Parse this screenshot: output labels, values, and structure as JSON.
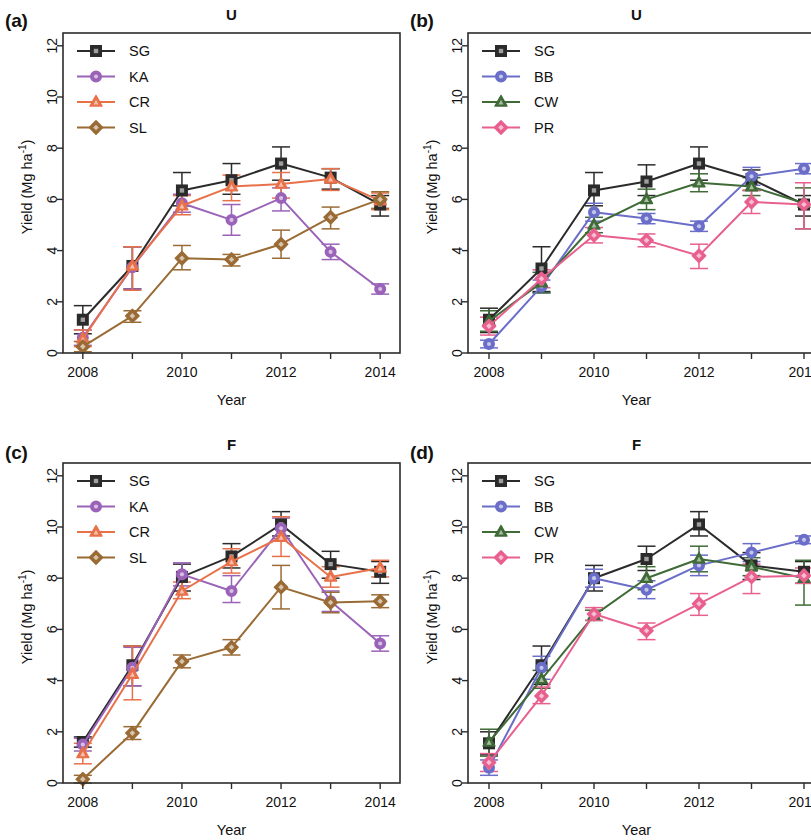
{
  "figure": {
    "panels": [
      {
        "id": "a",
        "label": "(a)",
        "title": "U",
        "xlabel": "Year",
        "ylabel": "Yield (Mg ha",
        "ylabel_sup": "-1",
        "ylabel_tail": ")"
      },
      {
        "id": "b",
        "label": "(b)",
        "title": "U",
        "xlabel": "Year",
        "ylabel": "Yield (Mg ha",
        "ylabel_sup": "-1",
        "ylabel_tail": ")"
      },
      {
        "id": "c",
        "label": "(c)",
        "title": "F",
        "xlabel": "Year",
        "ylabel": "Yield (Mg ha",
        "ylabel_sup": "-1",
        "ylabel_tail": ")"
      },
      {
        "id": "d",
        "label": "(d)",
        "title": "F",
        "xlabel": "Year",
        "ylabel": "Yield (Mg ha",
        "ylabel_sup": "-1",
        "ylabel_tail": ")"
      }
    ]
  },
  "colors": {
    "SG": "#2b2b2b",
    "KA": "#9a63b8",
    "CR": "#e8714a",
    "SL": "#9a6b35",
    "BB": "#6a6ec9",
    "CW": "#3f6b36",
    "PR": "#e8608f"
  },
  "chart_data": [
    {
      "panel": "a",
      "type": "line",
      "title": "U",
      "xlabel": "Year",
      "ylabel": "Yield (Mg ha-1)",
      "x": [
        2008,
        2009,
        2010,
        2011,
        2012,
        2013,
        2014
      ],
      "xticks": [
        2008,
        2009,
        2010,
        2011,
        2012,
        2013,
        2014
      ],
      "xticklabels": [
        "2008",
        "",
        "2010",
        "",
        "2012",
        "",
        "2014"
      ],
      "yticks": [
        0,
        2,
        4,
        6,
        8,
        10,
        12
      ],
      "yticklabels": [
        "0",
        "2",
        "4",
        "6",
        "8",
        "10",
        "12"
      ],
      "xlim": [
        2007.6,
        2014.4
      ],
      "ylim": [
        0,
        12.5
      ],
      "grid": false,
      "legend_position": "top-left",
      "series": [
        {
          "name": "SG",
          "marker": "square",
          "values": [
            1.3,
            3.4,
            6.35,
            6.75,
            7.4,
            6.85,
            5.8
          ],
          "err_lo": [
            0.55,
            0.9,
            0.6,
            0.55,
            0.65,
            0.45,
            0.45
          ],
          "err_hi": [
            0.55,
            0.75,
            0.7,
            0.65,
            0.65,
            0.35,
            0.35
          ]
        },
        {
          "name": "KA",
          "marker": "circle",
          "values": [
            0.6,
            3.35,
            5.85,
            5.2,
            6.05,
            3.95,
            2.5
          ],
          "err_lo": [
            0.3,
            0.85,
            0.35,
            0.6,
            0.5,
            0.3,
            0.2
          ],
          "err_hi": [
            0.3,
            0.8,
            0.35,
            0.6,
            0.4,
            0.3,
            0.2
          ]
        },
        {
          "name": "CR",
          "marker": "triangle",
          "values": [
            0.55,
            3.4,
            5.75,
            6.5,
            6.6,
            6.8,
            5.95
          ],
          "err_lo": [
            0.3,
            0.95,
            0.35,
            0.55,
            0.55,
            0.45,
            0.35
          ],
          "err_hi": [
            0.35,
            0.75,
            0.4,
            0.45,
            0.45,
            0.4,
            0.3
          ]
        },
        {
          "name": "SL",
          "marker": "diamond",
          "values": [
            0.25,
            1.45,
            3.7,
            3.65,
            4.25,
            5.3,
            6.0
          ],
          "err_lo": [
            0.2,
            0.25,
            0.45,
            0.25,
            0.55,
            0.45,
            0.35
          ],
          "err_hi": [
            0.2,
            0.2,
            0.5,
            0.2,
            0.55,
            0.4,
            0.3
          ]
        }
      ]
    },
    {
      "panel": "b",
      "type": "line",
      "title": "U",
      "xlabel": "Year",
      "ylabel": "Yield (Mg ha-1)",
      "x": [
        2008,
        2009,
        2010,
        2011,
        2012,
        2013,
        2014
      ],
      "xticks": [
        2008,
        2009,
        2010,
        2011,
        2012,
        2013,
        2014
      ],
      "xticklabels": [
        "2008",
        "",
        "2010",
        "",
        "2012",
        "",
        "2014"
      ],
      "yticks": [
        0,
        2,
        4,
        6,
        8,
        10,
        12
      ],
      "yticklabels": [
        "0",
        "2",
        "4",
        "6",
        "8",
        "10",
        "12"
      ],
      "xlim": [
        2007.6,
        2014.4
      ],
      "ylim": [
        0,
        12.5
      ],
      "grid": false,
      "legend_position": "top-left",
      "series": [
        {
          "name": "SG",
          "marker": "square",
          "values": [
            1.3,
            3.3,
            6.35,
            6.7,
            7.4,
            6.8,
            5.8
          ],
          "err_lo": [
            0.5,
            0.9,
            0.6,
            0.55,
            0.65,
            0.45,
            0.45
          ],
          "err_hi": [
            0.45,
            0.85,
            0.7,
            0.65,
            0.65,
            0.35,
            0.35
          ]
        },
        {
          "name": "BB",
          "marker": "circle",
          "values": [
            0.35,
            2.6,
            5.5,
            5.25,
            4.95,
            6.9,
            7.2
          ],
          "err_lo": [
            0.15,
            0.25,
            0.35,
            0.2,
            0.2,
            0.35,
            0.2
          ],
          "err_hi": [
            0.15,
            0.25,
            0.35,
            0.2,
            0.2,
            0.35,
            0.2
          ]
        },
        {
          "name": "CW",
          "marker": "triangle",
          "values": [
            1.25,
            2.75,
            5.0,
            6.0,
            6.65,
            6.5,
            5.85
          ],
          "err_lo": [
            0.4,
            0.4,
            0.3,
            0.4,
            0.35,
            0.35,
            1.0
          ],
          "err_hi": [
            0.4,
            0.4,
            0.3,
            0.4,
            0.35,
            0.35,
            0.6
          ]
        },
        {
          "name": "PR",
          "marker": "diamond",
          "values": [
            1.05,
            2.9,
            4.6,
            4.4,
            3.8,
            5.9,
            5.8
          ],
          "err_lo": [
            0.35,
            0.35,
            0.3,
            0.25,
            0.5,
            0.45,
            0.95
          ],
          "err_hi": [
            0.35,
            0.35,
            0.3,
            0.25,
            0.45,
            0.45,
            0.85
          ]
        }
      ]
    },
    {
      "panel": "c",
      "type": "line",
      "title": "F",
      "xlabel": "Year",
      "ylabel": "Yield (Mg ha-1)",
      "x": [
        2008,
        2009,
        2010,
        2011,
        2012,
        2013,
        2014
      ],
      "xticks": [
        2008,
        2009,
        2010,
        2011,
        2012,
        2013,
        2014
      ],
      "xticklabels": [
        "2008",
        "",
        "2010",
        "",
        "2012",
        "",
        "2014"
      ],
      "yticks": [
        0,
        2,
        4,
        6,
        8,
        10,
        12
      ],
      "yticklabels": [
        "0",
        "2",
        "4",
        "6",
        "8",
        "10",
        "12"
      ],
      "xlim": [
        2007.6,
        2014.4
      ],
      "ylim": [
        0,
        12.5
      ],
      "grid": false,
      "legend_position": "top-left",
      "series": [
        {
          "name": "SG",
          "marker": "square",
          "values": [
            1.6,
            4.6,
            8.05,
            8.85,
            10.1,
            8.55,
            8.25
          ],
          "err_lo": [
            0.2,
            0.8,
            0.55,
            0.45,
            0.45,
            0.55,
            0.45
          ],
          "err_hi": [
            0.2,
            0.75,
            0.5,
            0.5,
            0.5,
            0.5,
            0.4
          ]
        },
        {
          "name": "KA",
          "marker": "circle",
          "values": [
            1.5,
            4.5,
            8.15,
            7.5,
            9.95,
            7.1,
            5.45
          ],
          "err_lo": [
            0.25,
            0.7,
            0.45,
            0.45,
            0.4,
            0.4,
            0.3
          ],
          "err_hi": [
            0.25,
            0.8,
            0.45,
            0.6,
            0.4,
            0.4,
            0.3
          ]
        },
        {
          "name": "CR",
          "marker": "triangle",
          "values": [
            1.15,
            4.25,
            7.5,
            8.65,
            9.6,
            8.05,
            8.4
          ],
          "err_lo": [
            0.4,
            1.0,
            0.3,
            0.45,
            0.75,
            0.4,
            0.35
          ],
          "err_hi": [
            0.4,
            1.1,
            0.35,
            0.5,
            0.8,
            0.4,
            0.3
          ]
        },
        {
          "name": "SL",
          "marker": "diamond",
          "values": [
            0.15,
            1.95,
            4.75,
            5.3,
            7.65,
            7.05,
            7.1
          ],
          "err_lo": [
            0.15,
            0.25,
            0.25,
            0.3,
            0.85,
            0.4,
            0.25
          ],
          "err_hi": [
            0.15,
            0.25,
            0.25,
            0.3,
            0.85,
            0.4,
            0.25
          ]
        }
      ]
    },
    {
      "panel": "d",
      "type": "line",
      "title": "F",
      "xlabel": "Year",
      "ylabel": "Yield (Mg ha-1)",
      "x": [
        2008,
        2009,
        2010,
        2011,
        2012,
        2013,
        2014
      ],
      "xticks": [
        2008,
        2009,
        2010,
        2011,
        2012,
        2013,
        2014
      ],
      "xticklabels": [
        "2008",
        "",
        "2010",
        "",
        "2012",
        "",
        "2014"
      ],
      "yticks": [
        0,
        2,
        4,
        6,
        8,
        10,
        12
      ],
      "yticklabels": [
        "0",
        "2",
        "4",
        "6",
        "8",
        "10",
        "12"
      ],
      "xlim": [
        2007.6,
        2014.4
      ],
      "ylim": [
        0,
        12.5
      ],
      "grid": false,
      "legend_position": "top-left",
      "series": [
        {
          "name": "SG",
          "marker": "square",
          "values": [
            1.55,
            4.6,
            8.0,
            8.75,
            10.1,
            8.5,
            8.25
          ],
          "err_lo": [
            0.45,
            0.75,
            0.5,
            0.45,
            0.45,
            0.55,
            0.45
          ],
          "err_hi": [
            0.45,
            0.75,
            0.5,
            0.5,
            0.5,
            0.5,
            0.4
          ]
        },
        {
          "name": "BB",
          "marker": "circle",
          "values": [
            0.6,
            4.5,
            8.0,
            7.55,
            8.5,
            9.0,
            9.5
          ],
          "err_lo": [
            0.3,
            0.45,
            0.35,
            0.35,
            0.4,
            0.35,
            0.15
          ],
          "err_hi": [
            0.3,
            0.45,
            0.35,
            0.35,
            0.4,
            0.35,
            0.15
          ]
        },
        {
          "name": "CW",
          "marker": "triangle",
          "values": [
            1.6,
            4.05,
            6.55,
            8.0,
            8.75,
            8.45,
            8.0
          ],
          "err_lo": [
            0.55,
            0.35,
            0.2,
            0.45,
            0.5,
            0.35,
            1.05
          ],
          "err_hi": [
            0.5,
            0.35,
            0.2,
            0.45,
            0.5,
            0.35,
            0.7
          ]
        },
        {
          "name": "PR",
          "marker": "diamond",
          "values": [
            0.8,
            3.4,
            6.6,
            5.95,
            7.0,
            8.05,
            8.1
          ],
          "err_lo": [
            0.35,
            0.3,
            0.25,
            0.35,
            0.45,
            0.65,
            0.3
          ],
          "err_hi": [
            0.35,
            0.35,
            0.25,
            0.3,
            0.4,
            0.5,
            0.3
          ]
        }
      ]
    }
  ]
}
